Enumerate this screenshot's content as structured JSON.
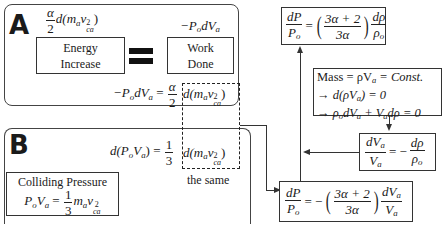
{
  "panel_a": {
    "label": "A",
    "energy_expr": {
      "coef_num": "α",
      "coef_den": "2",
      "body": "d(m",
      "m_sub": "a",
      "v": "v",
      "v_sup": "2",
      "v_sub": "ca",
      "close": ")"
    },
    "work_expr": "−P",
    "work_expr_sub": "o",
    "work_expr_rest": "dV",
    "work_expr_rest_sub": "a",
    "energy_box": {
      "line1": "Energy",
      "line2": "Increase"
    },
    "work_box": {
      "line1": "Work",
      "line2": "Done"
    },
    "equation": {
      "lhs": "−P",
      "lhs_sub": "o",
      "lhs_rest": "dV",
      "lhs_rest_sub": "a",
      "eq": "=",
      "coef_num": "α",
      "coef_den": "2"
    }
  },
  "panel_b": {
    "label": "B",
    "equation": {
      "lhs": "d(P",
      "lhs_sub": "o",
      "lhs_mid": "V",
      "lhs_mid_sub": "a",
      "lhs_close": ")",
      "eq": "=",
      "coef_num": "1",
      "coef_den": "3"
    },
    "colliding_box": {
      "title": "Colliding Pressure",
      "lhs": "P",
      "lhs_sub": "o",
      "lhs_mid": "V",
      "lhs_mid_sub": "a",
      "eq": "=",
      "coef_num": "1",
      "coef_den": "3"
    }
  },
  "shared_term": {
    "body": "d(m",
    "m_sub": "a",
    "v": "v",
    "v_sup": "2",
    "v_sub": "ca",
    "close": ")",
    "caption": "the same"
  },
  "right": {
    "top_box": {
      "lhs_num": "dP",
      "lhs_den": "P",
      "lhs_den_sub": "o",
      "eq": "=",
      "inner_num": "3α + 2",
      "inner_den": "3α",
      "rhs_num": "dρ",
      "rhs_den": "ρ",
      "rhs_den_sub": "o"
    },
    "mass_box": {
      "line1": "Mass = ρV",
      "line1_sub": "a",
      "line1_rest": " = Const.",
      "line2": "→ d(ρV",
      "line2_sub": "a",
      "line2_rest": ") = 0",
      "line3": "→ ρ",
      "line3_sub": "o",
      "line3_mid": "dV",
      "line3_mid_sub": "a",
      "line3_rest": " + V",
      "line3_rest_sub": "a",
      "line3_end": "dρ = 0"
    },
    "ratio_box": {
      "lhs_num": "dV",
      "lhs_num_sub": "a",
      "lhs_den": "V",
      "lhs_den_sub": "a",
      "eq": "= −",
      "rhs_num": "dρ",
      "rhs_den": "ρ",
      "rhs_den_sub": "o"
    },
    "bottom_box": {
      "lhs_num": "dP",
      "lhs_den": "P",
      "lhs_den_sub": "o",
      "eq": "= −",
      "inner_num": "3α + 2",
      "inner_den": "3α",
      "rhs_num": "dV",
      "rhs_num_sub": "a",
      "rhs_den": "V",
      "rhs_den_sub": "a"
    }
  }
}
